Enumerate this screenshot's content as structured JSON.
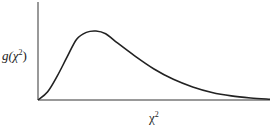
{
  "chart_data": {
    "type": "line",
    "title": "",
    "xlabel": "χ²",
    "ylabel": "g(χ²)",
    "series": [
      {
        "name": "chi-square density",
        "points": [
          [
            0,
            0
          ],
          [
            0.5,
            0.12
          ],
          [
            1,
            0.35
          ],
          [
            1.5,
            0.62
          ],
          [
            2,
            0.88
          ],
          [
            2.5,
            0.98
          ],
          [
            3,
            1.0
          ],
          [
            3.5,
            0.96
          ],
          [
            4,
            0.85
          ],
          [
            5,
            0.64
          ],
          [
            6,
            0.45
          ],
          [
            7,
            0.3
          ],
          [
            8,
            0.19
          ],
          [
            9,
            0.11
          ],
          [
            10,
            0.06
          ],
          [
            11,
            0.03
          ],
          [
            12,
            0.01
          ]
        ]
      }
    ],
    "grid": false,
    "legend": null,
    "ticks": "none"
  },
  "labels": {
    "y_main": "g(χ",
    "y_sup": "2",
    "y_close": ")",
    "x_main": "χ",
    "x_sup": "2"
  },
  "colors": {
    "axis": "#555555",
    "curve": "#222222"
  }
}
